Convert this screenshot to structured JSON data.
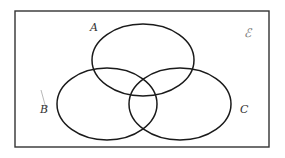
{
  "diagram": {
    "type": "venn",
    "universal_set": {
      "label": "ℰ"
    },
    "sets": [
      {
        "id": "A",
        "label": "A"
      },
      {
        "id": "B",
        "label": "B"
      },
      {
        "id": "C",
        "label": "C"
      }
    ],
    "colors": {
      "stroke": "#1a1a1a",
      "background": "#ffffff"
    }
  }
}
